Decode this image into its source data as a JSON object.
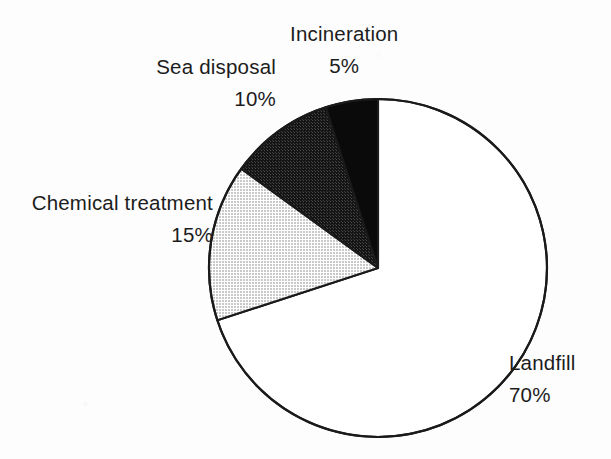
{
  "figure": {
    "background_color": "#fdfdfd",
    "text_color": "#1c1c1c"
  },
  "chart_data": {
    "type": "pie",
    "title": "",
    "subtitle": "",
    "xlabel": "",
    "ylabel": "",
    "legend_position": "none",
    "labels_position": "outside-callout",
    "grid": false,
    "units": "percent",
    "total": 100,
    "start_angle_deg": 0,
    "direction": "counterclockwise",
    "center": {
      "x": 378,
      "y": 268
    },
    "radius": 169,
    "categories": [
      "Landfill",
      "Chemical treatment",
      "Sea disposal",
      "Incineration"
    ],
    "values": [
      70,
      15,
      10,
      5
    ],
    "value_labels": [
      "70%",
      "15%",
      "10%",
      "5%"
    ],
    "slices": [
      {
        "label": "Landfill",
        "value": 70,
        "value_label": "70%",
        "fill": "#ffffff",
        "fill_name": "white",
        "stroke": "#1a1a1a"
      },
      {
        "label": "Chemical treatment",
        "value": 15,
        "value_label": "15%",
        "fill": "#d9d9d9",
        "fill_name": "light-gray",
        "stroke": "#1a1a1a"
      },
      {
        "label": "Sea disposal",
        "value": 10,
        "value_label": "10%",
        "fill": "#2b2b2b",
        "fill_name": "dark-gray",
        "stroke": "#1a1a1a"
      },
      {
        "label": "Incineration",
        "value": 5,
        "value_label": "5%",
        "fill": "#0a0a0a",
        "fill_name": "black",
        "stroke": "#1a1a1a"
      }
    ]
  },
  "callouts": {
    "incineration": {
      "name": "Incineration",
      "value": "5%"
    },
    "sea_disposal": {
      "name": "Sea disposal",
      "value": "10%"
    },
    "chemical_treatment": {
      "name": "Chemical treatment",
      "value": "15%"
    },
    "landfill": {
      "name": "Landfill",
      "value": "70%"
    }
  }
}
